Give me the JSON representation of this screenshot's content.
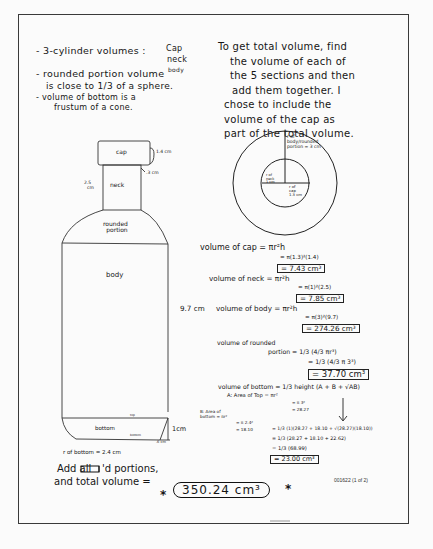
{
  "notes_left": {
    "line1": "- 3-cylinder volumes :",
    "cyl_list": [
      "Cap",
      "neck",
      "body"
    ],
    "line2": "- rounded portion volume",
    "line3": "is close to 1/3 of a sphere.",
    "line4": "- volume of bottom is a",
    "line5": "frustum of a cone."
  },
  "notes_right": {
    "lines": [
      "To get total volume, find",
      "the volume of each of",
      "the 5 sections and then",
      "add them together. I",
      "chose to include the",
      "volume of the cap as",
      "part of the total volume."
    ]
  },
  "circle_diagram": {
    "outer_label_1": "r of",
    "outer_label_2": "body/rounded",
    "outer_label_3": "portion = 3 cm",
    "inner_left_1": "r of",
    "inner_left_2": "neck",
    "inner_left_3": "1 cm",
    "inner_right_1": "r of",
    "inner_right_2": "cap",
    "inner_right_3": "1.3 cm"
  },
  "bottle_diagram": {
    "cap_label": "cap",
    "cap_height": "1.4 cm",
    "cap_overhang": ".3 cm",
    "neck_label": "neck",
    "neck_height_1": "2.5",
    "neck_height_2": "cm",
    "rounded_label_1": "rounded",
    "rounded_label_2": "portion",
    "body_label": "body",
    "body_height": "9.7 cm",
    "bottom_label": "bottom",
    "bottom_top_mark": "top",
    "bottom_bot_mark": "bottom",
    "bottom_height": "1cm",
    "bottom_offset": ".6 cm",
    "bottom_radius": "r of bottom = 2.4 cm"
  },
  "calculations": {
    "cap": {
      "line1": "volume of cap = πr²h",
      "line2": "= π(1.3)²(1.4)",
      "result": "= 7.43 cm³"
    },
    "neck": {
      "line1": "volume of neck = πr²h",
      "line2": "= π(1)²(2.5)",
      "result": "= 7.85 cm³"
    },
    "body": {
      "prefix": "9.7 cm",
      "line1": "volume of body = πr²h",
      "line2": "= π(3)²(9.7)",
      "result": "= 274.26 cm³"
    },
    "rounded": {
      "line1a": "volume of rounded",
      "line1b": "portion = 1/3 (4/3 πr³)",
      "line2": "= 1/3 (4/3 π 3³)",
      "result": "= 37.70 cm³"
    },
    "bottom": {
      "line1": "volume of bottom = 1/3 height (A + B + √AB)",
      "a_label": "A: Area of Top = πr²",
      "a_line2": "= π 3²",
      "a_line3": "= 28.27",
      "b_label_1": "B: Area of",
      "b_label_2": "bottom = πr²",
      "b_line2": "= π 2.4²",
      "b_line3": "= 18.10",
      "step1": "= 1/3 (1)(28.27 + 18.10 + √(28.27)(18.10))",
      "step2": "= 1/3 (28.27 + 18.10 + 22.62)",
      "step3": "= 1/3 (68.99)",
      "result": "= 23.00 cm³"
    }
  },
  "summary": {
    "line1a": "Add all",
    "line1b": "'d portions,",
    "line2": "and total volume =",
    "star": "*",
    "total": "350.24 cm³"
  },
  "document_id": "001622 (1 of 2)"
}
